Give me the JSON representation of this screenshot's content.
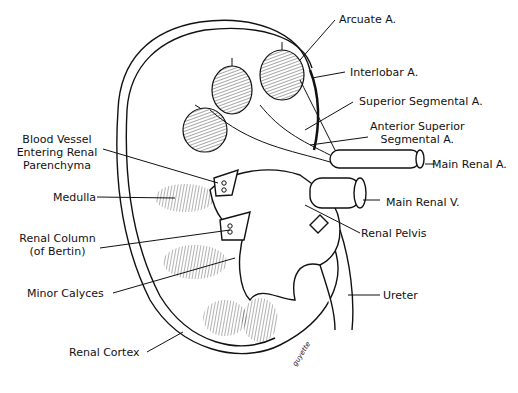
{
  "diagram": {
    "labels": {
      "arcuate": "Arcuate A.",
      "interlobar": "Interlobar A.",
      "superior_segmental": "Superior Segmental A.",
      "anterior_superior_1": "Anterior Superior",
      "anterior_superior_2": "Segmental A.",
      "main_renal_a": "Main Renal A.",
      "main_renal_v": "Main Renal V.",
      "renal_pelvis": "Renal Pelvis",
      "ureter": "Ureter",
      "blood_vessel_1": "Blood Vessel",
      "blood_vessel_2": "Entering Renal",
      "blood_vessel_3": "Parenchyma",
      "medulla": "Medulla",
      "renal_column_1": "Renal Column",
      "renal_column_2": "(of Bertin)",
      "minor_calyces": "Minor Calyces",
      "renal_cortex": "Renal Cortex"
    },
    "signature": "guyette"
  }
}
